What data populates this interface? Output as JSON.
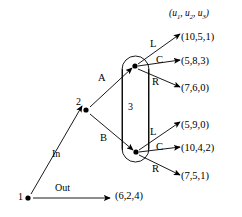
{
  "figure": {
    "header_label": {
      "prefix": "(u",
      "sub1": "1",
      "mid1": ", u",
      "sub2": "2",
      "mid2": ", u",
      "sub3": "3",
      "suffix": ")",
      "plain": "(u1, u2, u3)"
    }
  },
  "nodes": [
    {
      "id": "n1",
      "label": "1",
      "player": "1",
      "x": 28,
      "y": 198
    },
    {
      "id": "n2",
      "label": "2",
      "player": "2",
      "x": 86,
      "y": 110
    },
    {
      "id": "n3a",
      "label": "",
      "player": "3",
      "x": 135,
      "y": 66
    },
    {
      "id": "n3b",
      "label": "",
      "player": "3",
      "x": 136,
      "y": 152
    }
  ],
  "information_set": {
    "label": "3",
    "label_x": 131,
    "label_y": 108,
    "members": [
      "n3a",
      "n3b"
    ]
  },
  "edges": [
    {
      "id": "e-out",
      "from": "n1",
      "label": "Out",
      "label_x": 62,
      "label_y": 189
    },
    {
      "id": "e-in",
      "from": "n1",
      "to": "n2",
      "label": "In",
      "label_x": 57,
      "label_y": 155
    },
    {
      "id": "e-a",
      "from": "n2",
      "to": "n3a",
      "label": "A",
      "label_x": 102,
      "label_y": 80
    },
    {
      "id": "e-b",
      "from": "n2",
      "to": "n3b",
      "label": "B",
      "label_x": 104,
      "label_y": 140
    },
    {
      "id": "e-top-l",
      "from": "n3a",
      "label": "L",
      "label_x": 153,
      "label_y": 45
    },
    {
      "id": "e-top-c",
      "from": "n3a",
      "label": "C",
      "label_x": 159,
      "label_y": 61
    },
    {
      "id": "e-top-r",
      "from": "n3a",
      "label": "R",
      "label_x": 156,
      "label_y": 83
    },
    {
      "id": "e-bot-l",
      "from": "n3b",
      "label": "L",
      "label_x": 153,
      "label_y": 133
    },
    {
      "id": "e-bot-c",
      "from": "n3b",
      "label": "C",
      "label_x": 159,
      "label_y": 148
    },
    {
      "id": "e-bot-r",
      "from": "n3b",
      "label": "R",
      "label_x": 156,
      "label_y": 170
    }
  ],
  "payoffs": [
    {
      "id": "p-top-l",
      "text": "(10,5,1)",
      "x": 183,
      "y": 38
    },
    {
      "id": "p-top-c",
      "text": "(5,8,3)",
      "x": 183,
      "y": 62
    },
    {
      "id": "p-top-r",
      "text": "(7,6,0)",
      "x": 183,
      "y": 89
    },
    {
      "id": "p-bot-l",
      "text": "(5,9,0)",
      "x": 183,
      "y": 126
    },
    {
      "id": "p-bot-c",
      "text": "(10,4,2)",
      "x": 183,
      "y": 149
    },
    {
      "id": "p-bot-r",
      "text": "(7,5,1)",
      "x": 183,
      "y": 177
    },
    {
      "id": "p-out",
      "text": "(6,2,4)",
      "x": 116,
      "y": 197
    }
  ],
  "colors": {
    "stroke": "#000000",
    "background": "#ffffff"
  }
}
